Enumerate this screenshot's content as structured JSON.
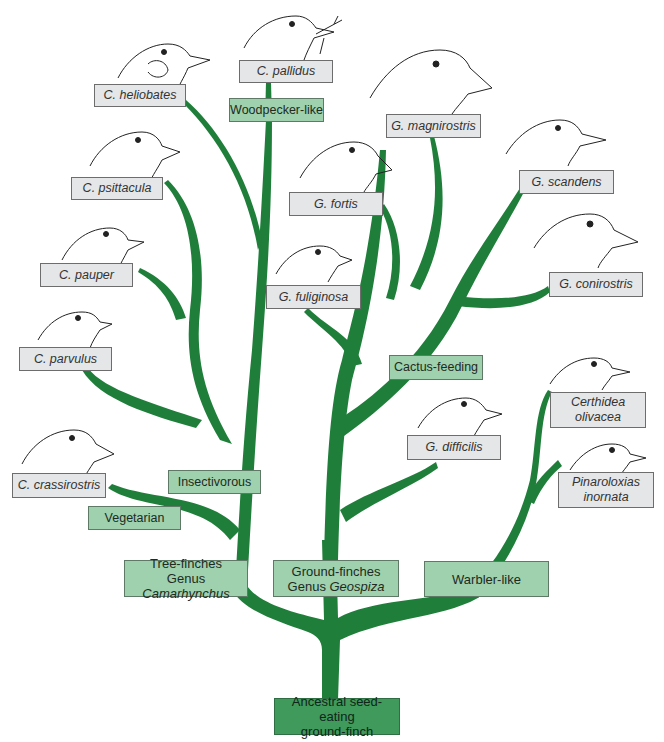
{
  "diagram": {
    "type": "phylogenetic-tree",
    "branch_color": "#1f7f3a",
    "species_box_color": "#e4e6e8",
    "trait_box_color": "#9fd1ae",
    "root_box_color": "#3f9a5b"
  },
  "root": {
    "line1": "Ancestral seed-eating",
    "line2": "ground-finch"
  },
  "groups": {
    "tree_finches": {
      "line1": "Tree-finches",
      "line2_prefix": "Genus ",
      "genus": "Camarhynchus"
    },
    "ground_finches": {
      "line1": "Ground-finches",
      "line2_prefix": "Genus ",
      "genus": "Geospiza"
    },
    "warbler_like": {
      "label": "Warbler-like"
    }
  },
  "traits": {
    "woodpecker_like": "Woodpecker-like",
    "insectivorous": "Insectivorous",
    "vegetarian": "Vegetarian",
    "cactus_feeding": "Cactus-feeding"
  },
  "species": {
    "c_pallidus": "C. pallidus",
    "c_heliobates": "C. heliobates",
    "c_psittacula": "C. psittacula",
    "c_pauper": "C. pauper",
    "c_parvulus": "C. parvulus",
    "c_crassirostris": "C. crassirostris",
    "g_magnirostris": "G. magnirostris",
    "g_fortis": "G. fortis",
    "g_fuliginosa": "G. fuliginosa",
    "g_scandens": "G. scandens",
    "g_conirostris": "G. conirostris",
    "g_difficilis": "G. difficilis",
    "certhidea_line1": "Certhidea",
    "certhidea_line2": "olivacea",
    "pinaroloxias_line1": "Pinaroloxias",
    "pinaroloxias_line2": "inornata"
  }
}
